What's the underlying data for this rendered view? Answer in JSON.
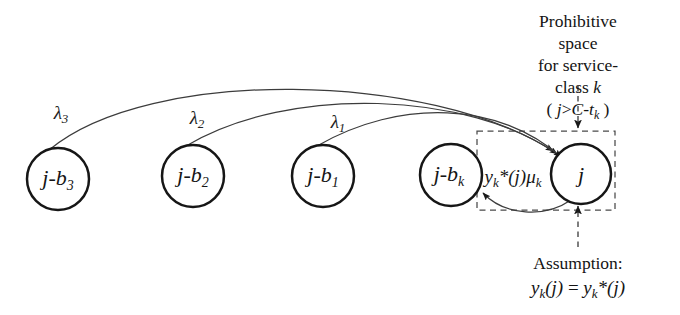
{
  "figure": {
    "type": "state-transition-diagram",
    "background_color": "#ffffff",
    "stroke_color": "#1a1a1a",
    "thin_stroke_color": "#3a3a3a",
    "dashed_stroke_color": "#444444"
  },
  "nodes": [
    {
      "id": "n3",
      "label_main": "j-b",
      "label_sub": "3",
      "cx": 58,
      "cy": 179,
      "r": 31
    },
    {
      "id": "n2",
      "label_main": "j-b",
      "label_sub": "2",
      "cx": 193,
      "cy": 176,
      "r": 31
    },
    {
      "id": "n1",
      "label_main": "j-b",
      "label_sub": "1",
      "cx": 323,
      "cy": 176,
      "r": 31
    },
    {
      "id": "nk",
      "label_main": "j-b",
      "label_sub": "k",
      "cx": 451,
      "cy": 175,
      "r": 31
    },
    {
      "id": "nj",
      "label_main": "j",
      "label_sub": "",
      "cx": 581,
      "cy": 174,
      "r": 30
    }
  ],
  "arrival_rates": [
    {
      "id": "lambda3",
      "symbol": "λ",
      "sub": "3",
      "x": 61,
      "y": 114,
      "from": "n3",
      "to": "nj"
    },
    {
      "id": "lambda2",
      "symbol": "λ",
      "sub": "2",
      "x": 197,
      "y": 119,
      "from": "n2",
      "to": "nj"
    },
    {
      "id": "lambda1",
      "symbol": "λ",
      "sub": "1",
      "x": 338,
      "y": 123,
      "from": "n1",
      "to": "nj"
    }
  ],
  "service_rate": {
    "id": "service-rate",
    "text_parts": {
      "y": "y",
      "sub_k": "k",
      "star": "*",
      "of_j": "(j)",
      "mu": "μ",
      "mu_sub": "k"
    },
    "plain": "y_k*(j)μ_k",
    "x": 513,
    "y": 178,
    "from": "nj",
    "to": "nk"
  },
  "prohibitive_box": {
    "id": "prohibitive-space-box",
    "x": 477,
    "y": 131,
    "width": 138,
    "height": 79,
    "style": "dashed"
  },
  "callouts": {
    "top": {
      "id": "prohibitive-space-callout",
      "line1": "Prohibitive space",
      "line2_prefix": "for service-class ",
      "line2_italic": "k",
      "line3_open": "( ",
      "line3_j": "j",
      "line3_gt": ">",
      "line3_C": "C",
      "line3_minus": "-",
      "line3_t": "t",
      "line3_sub": "k",
      "line3_close": " )",
      "line3_plain": "( j>C-t_k )",
      "x": 578,
      "y": 10,
      "leader": {
        "x": 578,
        "y_start": 86,
        "y_end": 130,
        "style": "dashed",
        "arrow": "down"
      }
    },
    "bottom": {
      "id": "assumption-callout",
      "line1": "Assumption:",
      "line2_plain": "y_k(j) = y_k*(j)",
      "line2_left_y": "y",
      "line2_left_sub": "k",
      "line2_left_arg": "(j)",
      "line2_eq": " = ",
      "line2_right_y": "y",
      "line2_right_sub": "k",
      "line2_right_star": "*",
      "line2_right_arg": "(j)",
      "x": 578,
      "y": 252,
      "leader": {
        "x": 578,
        "y_start": 246,
        "y_end": 205,
        "style": "dashed",
        "arrow": "up"
      }
    }
  }
}
